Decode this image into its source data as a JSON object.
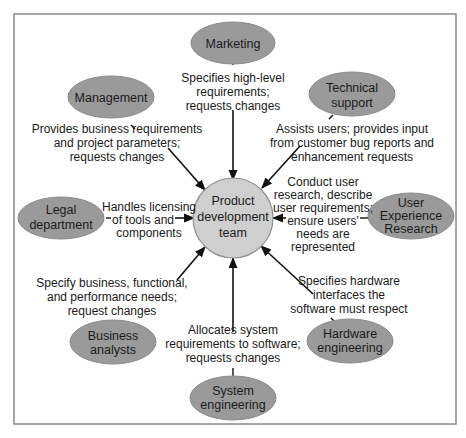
{
  "diagram": {
    "center": {
      "label_lines": [
        "Product",
        "development",
        "team"
      ]
    },
    "nodes": [
      {
        "id": "marketing",
        "label_lines": [
          "Marketing"
        ],
        "edge_lines": [
          "Specifies high-level",
          "requirements;",
          "requests changes"
        ]
      },
      {
        "id": "management",
        "label_lines": [
          "Management"
        ],
        "edge_lines": [
          "Provides business requirements",
          "and project parameters;",
          "requests changes"
        ]
      },
      {
        "id": "technical-support",
        "label_lines": [
          "Technical",
          "support"
        ],
        "edge_lines": [
          "Assists users; provides input",
          "from customer bug reports and",
          "enhancement requests"
        ]
      },
      {
        "id": "legal-department",
        "label_lines": [
          "Legal",
          "department"
        ],
        "edge_lines": [
          "Handles licensing",
          "of tools and",
          "components"
        ]
      },
      {
        "id": "user-experience-research",
        "label_lines": [
          "User",
          "Experience",
          "Research"
        ],
        "edge_lines": [
          "Conduct user",
          "research, describe",
          "user requirements;",
          "ensure users'",
          "needs are",
          "represented"
        ]
      },
      {
        "id": "business-analysts",
        "label_lines": [
          "Business",
          "analysts"
        ],
        "edge_lines": [
          "Specify business, functional,",
          "and performance needs;",
          "request changes"
        ]
      },
      {
        "id": "system-engineering",
        "label_lines": [
          "System",
          "engineering"
        ],
        "edge_lines": [
          "Allocates system",
          "requirements to software;",
          "requests changes"
        ]
      },
      {
        "id": "hardware-engineering",
        "label_lines": [
          "Hardware",
          "engineering"
        ],
        "edge_lines": [
          "Specifies hardware",
          "interfaces the",
          "software must respect"
        ]
      }
    ],
    "colors": {
      "node_fill": "#9a9a9a",
      "hub_fill": "#cfcfcf",
      "frame": "#8a8a8a",
      "text": "#1a1a1a"
    }
  }
}
